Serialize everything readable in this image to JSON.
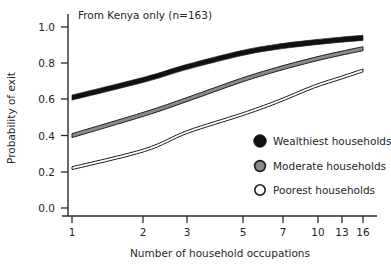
{
  "figure": {
    "panel_title": "From Kenya only (n=163)",
    "background_color": "#ffffff",
    "foreground_color": "#262626"
  },
  "axes": {
    "y_title": "Probability of exit",
    "x_title": "Number of household occupations",
    "y_ticks": [
      "0.0",
      "0.2",
      "0.4",
      "0.6",
      "0.8",
      "1.0"
    ],
    "x_ticks": [
      "1",
      "2",
      "3",
      "5",
      "7",
      "10",
      "13",
      "16"
    ]
  },
  "legend": {
    "items": [
      {
        "label": "Wealthiest households",
        "marker": "filled-circle-black",
        "color": "#111111"
      },
      {
        "label": "Moderate households",
        "marker": "filled-circle-gray",
        "color": "#8a8a8a"
      },
      {
        "label": "Poorest households",
        "marker": "hollow-circle-white",
        "color": "#ffffff"
      }
    ]
  },
  "chart_data": {
    "type": "line",
    "title": "From Kenya only (n=163)",
    "xlabel": "Number of household occupations",
    "ylabel": "Probability of exit",
    "x_scale": "log",
    "x": [
      1,
      2,
      3,
      5,
      7,
      10,
      13,
      16
    ],
    "xlim": [
      1,
      16
    ],
    "ylim": [
      0.0,
      1.0
    ],
    "grid": false,
    "legend_position": "center-right",
    "series": [
      {
        "name": "Wealthiest households",
        "color": "#111111",
        "band_width": 0.028,
        "values": [
          0.61,
          0.71,
          0.78,
          0.855,
          0.89,
          0.915,
          0.93,
          0.94
        ]
      },
      {
        "name": "Moderate households",
        "color": "#8a8a8a",
        "band_width": 0.022,
        "values": [
          0.4,
          0.52,
          0.6,
          0.705,
          0.765,
          0.82,
          0.855,
          0.88
        ]
      },
      {
        "name": "Poorest households",
        "color": "#ffffff",
        "band_width": 0.016,
        "values": [
          0.22,
          0.32,
          0.42,
          0.515,
          0.585,
          0.67,
          0.72,
          0.76
        ]
      }
    ]
  }
}
